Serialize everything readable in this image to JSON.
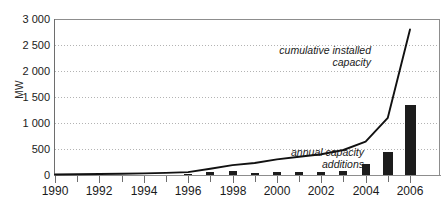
{
  "axis": {
    "ylabel": "MW",
    "yticks": [
      "3 000",
      "2 500",
      "2 000",
      "1 500",
      "1 000",
      "500",
      "0"
    ],
    "xticks": [
      "1990",
      "1992",
      "1994",
      "1996",
      "1998",
      "2000",
      "2002",
      "2004",
      "2006"
    ]
  },
  "annotations": {
    "cumulative": "cumulative installed capacity",
    "annual": "annual capacity additions"
  },
  "colors": {
    "bar": "#1c1c1c",
    "line": "#111111",
    "grid": "#b3b3b3",
    "axis": "#6e6e6e",
    "text": "#1a1a1a"
  },
  "chart_data": {
    "type": "bar",
    "title": "",
    "xlabel": "",
    "ylabel": "MW",
    "ylim": [
      0,
      3000
    ],
    "xlim": [
      1990,
      2006
    ],
    "grid": true,
    "legend": "annotations",
    "ytick_values": [
      3000,
      2500,
      2000,
      1500,
      1000,
      500,
      0
    ],
    "xtick_values": [
      1990,
      1992,
      1994,
      1996,
      1998,
      2000,
      2002,
      2004,
      2006
    ],
    "x": [
      1990,
      1991,
      1992,
      1993,
      1994,
      1995,
      1996,
      1997,
      1998,
      1999,
      2000,
      2001,
      2002,
      2003,
      2004,
      2005,
      2006
    ],
    "series": [
      {
        "name": "annual capacity additions",
        "type": "bar",
        "values": [
          0,
          0,
          0,
          0,
          0,
          0,
          5,
          60,
          70,
          35,
          65,
          50,
          50,
          75,
          210,
          450,
          1350
        ]
      },
      {
        "name": "cumulative installed capacity",
        "type": "line",
        "values": [
          10,
          15,
          20,
          25,
          30,
          40,
          55,
          120,
          190,
          230,
          300,
          350,
          400,
          480,
          640,
          1100,
          2800
        ]
      }
    ]
  }
}
